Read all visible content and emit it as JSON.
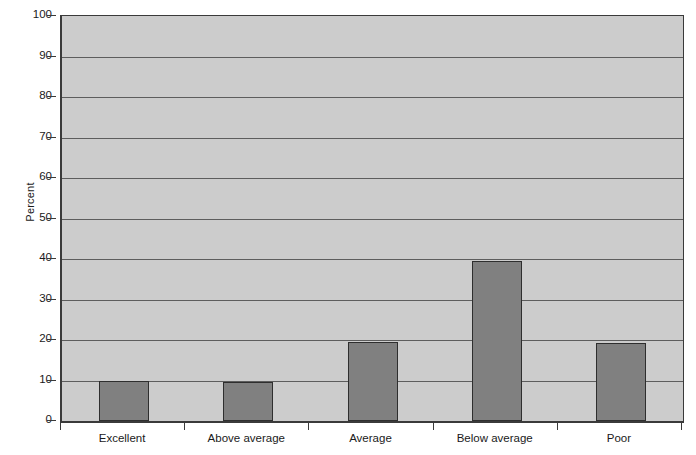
{
  "chart_data": {
    "type": "bar",
    "title": "",
    "subtitle": "",
    "xlabel": "",
    "ylabel": "Percent",
    "categories": [
      "Excellent",
      "Above average",
      "Average",
      "Below average",
      "Poor"
    ],
    "values": [
      9.8,
      9.7,
      19.6,
      39.4,
      19.3
    ],
    "series": [
      {
        "name": "Percent",
        "values": [
          9.8,
          9.7,
          19.6,
          39.4,
          19.3
        ]
      }
    ],
    "ylim": [
      0,
      100
    ],
    "ytick_values": [
      0,
      10,
      20,
      30,
      40,
      50,
      60,
      70,
      80,
      90,
      100
    ],
    "ytick_labels": [
      "0",
      "10",
      "20",
      "30",
      "40",
      "50",
      "60",
      "70",
      "80",
      "90",
      "100"
    ],
    "grid": true,
    "grid_axis": "y",
    "legend": false,
    "legend_position": "none",
    "annotations": []
  },
  "style": {
    "plot_background": "#cccccc",
    "page_background": "#ffffff",
    "bar_fill": "#808080",
    "bar_border": "#2e2e2e",
    "gridline_color": "#5d5d5d",
    "axis_color": "#3a3a3a",
    "text_color": "#1a1a1a"
  },
  "axis": {
    "y_title": "Percent"
  }
}
